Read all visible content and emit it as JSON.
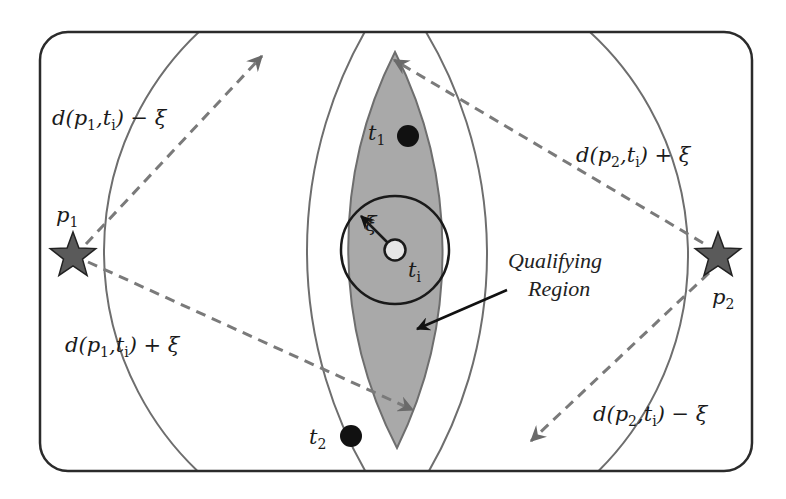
{
  "diagram": {
    "points": [
      {
        "id": "p1",
        "label": "p",
        "subscript": "1",
        "kind": "star"
      },
      {
        "id": "p2",
        "label": "p",
        "subscript": "2",
        "kind": "star"
      },
      {
        "id": "ti",
        "label": "t",
        "subscript": "i",
        "kind": "hollow-dot"
      },
      {
        "id": "t1",
        "label": "t",
        "subscript": "1",
        "kind": "filled-dot"
      },
      {
        "id": "t2",
        "label": "t",
        "subscript": "2",
        "kind": "filled-dot"
      }
    ],
    "radius_symbol": "ξ",
    "distance_labels": {
      "p1_minus": {
        "pre": "d(p",
        "s1": "1",
        "mid": ",t",
        "s2": "i",
        "post": ") − ξ"
      },
      "p1_plus": {
        "pre": "d(p",
        "s1": "1",
        "mid": ",t",
        "s2": "i",
        "post": ") + ξ"
      },
      "p2_plus": {
        "pre": "d(p",
        "s1": "2",
        "mid": ",t",
        "s2": "i",
        "post": ") + ξ"
      },
      "p2_minus": {
        "pre": "d(p",
        "s1": "2",
        "mid": ",t",
        "s2": "i",
        "post": ") − ξ"
      }
    },
    "annotation": {
      "line1": "Qualifying",
      "line2": "Region"
    },
    "colors": {
      "border": "#2b2b2b",
      "arc": "#6e6e6e",
      "region_fill": "#a9a9a9",
      "star_fill": "#5a5a5a",
      "dashed_arrow": "#7a7a7a",
      "dot": "#111111",
      "hollow_dot": "#e6e6e6"
    }
  }
}
